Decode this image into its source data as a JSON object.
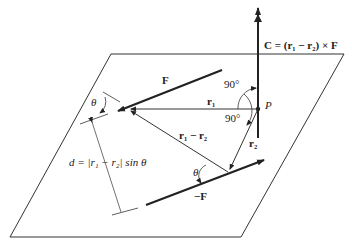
{
  "diagram": {
    "labels": {
      "moment": "C = (r₁ − r₂) × F",
      "force": "F",
      "neg_force": "−F",
      "r1": "r₁",
      "r2": "r₂",
      "r1_minus_r2": "r₁ − r₂",
      "point": "P",
      "angle_top": "90°",
      "angle_bottom": "90°",
      "theta_left": "θ",
      "theta_bottom": "θ",
      "distance": "d = |r₁ − r₂| sin θ"
    },
    "colors": {
      "line": "#222222",
      "background": "#ffffff"
    }
  }
}
